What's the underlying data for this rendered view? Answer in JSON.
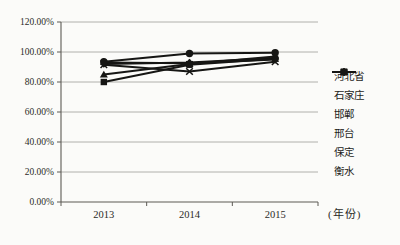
{
  "background_color": "#fbfbf9",
  "line_color": "#161614",
  "gridline_color": "#a09e99",
  "axis_color": "#5c5a55",
  "chart_data": {
    "type": "line",
    "title": "",
    "categories": [
      "2013",
      "2014",
      "2015"
    ],
    "x_unit_label": "(年份)",
    "xlabel": "",
    "ylabel": "",
    "ylim": [
      0,
      120
    ],
    "ytick_step": 20,
    "ytick_labels": [
      "0.00%",
      "20.00%",
      "40.00%",
      "60.00%",
      "80.00%",
      "100.00%",
      "120.00%"
    ],
    "grid": true,
    "legend_position": "right",
    "value_unit": "percent",
    "series": [
      {
        "id": "hebei",
        "name": "河北省",
        "marker": "diamond",
        "values": [
          92,
          93,
          96
        ]
      },
      {
        "id": "shijiazhuang",
        "name": "石家庄",
        "marker": "square",
        "values": [
          80,
          91.5,
          95.5
        ]
      },
      {
        "id": "handan",
        "name": "邯郸",
        "marker": "triangle",
        "values": [
          85,
          92,
          97
        ]
      },
      {
        "id": "xingtai",
        "name": "邢台",
        "marker": "x",
        "values": [
          91.5,
          87,
          93.5
        ]
      },
      {
        "id": "baoding",
        "name": "保定",
        "marker": "star",
        "values": [
          93,
          92.5,
          95
        ]
      },
      {
        "id": "hengshui",
        "name": "衡水",
        "marker": "circle",
        "values": [
          93.5,
          99,
          99.5
        ]
      }
    ]
  }
}
